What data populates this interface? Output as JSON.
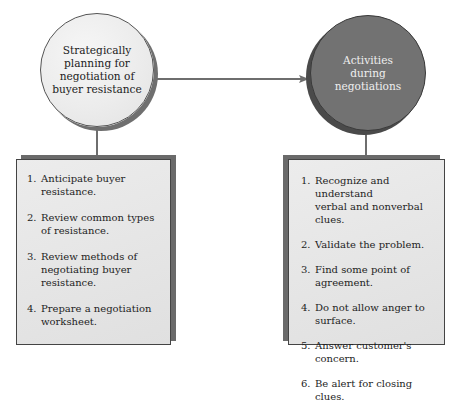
{
  "diagram": {
    "nodes": {
      "planning": {
        "label": "Strategically\nplanning for\nnegotiation of\nbuyer resistance",
        "fill": "#ececec",
        "text_color": "#1c1c1c"
      },
      "activities": {
        "label": "Activities\nduring\nnegotiations",
        "fill": "#727272",
        "text_color": "#efefef"
      }
    },
    "edges": [
      {
        "from": "planning",
        "to": "activities",
        "type": "arrow"
      }
    ],
    "planning_steps": [
      {
        "num": "1.",
        "text": "Anticipate buyer resistance."
      },
      {
        "num": "2.",
        "text": "Review common types\nof resistance."
      },
      {
        "num": "3.",
        "text": "Review methods of\nnegotiating buyer resistance."
      },
      {
        "num": "4.",
        "text": "Prepare a negotiation\nworksheet."
      }
    ],
    "activity_steps": [
      {
        "num": "1.",
        "text": "Recognize and understand\nverbal and nonverbal clues."
      },
      {
        "num": "2.",
        "text": "Validate the problem."
      },
      {
        "num": "3.",
        "text": "Find some point of agreement."
      },
      {
        "num": "4.",
        "text": "Do not allow anger to surface."
      },
      {
        "num": "5.",
        "text": "Answer customer's concern."
      },
      {
        "num": "6.",
        "text": "Be alert for closing clues."
      }
    ],
    "colors": {
      "connector": "#6e6e6e",
      "box_fill": "#e6e6e6",
      "box_shadow": "#6a6a6a"
    }
  }
}
